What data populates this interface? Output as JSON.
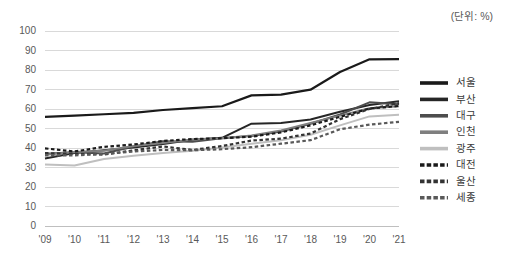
{
  "unit_note": "(단위: %)",
  "chart_data": {
    "type": "line",
    "title": "",
    "xlabel": "",
    "ylabel": "",
    "unit": "(단위: %)",
    "ylim": [
      0,
      100
    ],
    "ytick_step": 10,
    "yticks": [
      "0",
      "10",
      "20",
      "30",
      "40",
      "50",
      "60",
      "70",
      "80",
      "90",
      "100"
    ],
    "grid": true,
    "legend_position": "right",
    "categories": [
      "'09",
      "'10",
      "'11",
      "'12",
      "'13",
      "'14",
      "'15",
      "'16",
      "'17",
      "'18",
      "'19",
      "'20",
      "'21"
    ],
    "series": [
      {
        "name": "서울",
        "color": "#1a1a1a",
        "width": 2.2,
        "dash": "none",
        "values": [
          56.0,
          56.6,
          57.3,
          58.0,
          59.5,
          60.4,
          61.4,
          67.0,
          67.4,
          69.9,
          79.0,
          85.5,
          85.6
        ]
      },
      {
        "name": "부산",
        "color": "#262626",
        "width": 2.0,
        "dash": "none",
        "values": [
          34.6,
          37.4,
          38.8,
          40.2,
          42.0,
          44.2,
          45.2,
          52.5,
          52.8,
          54.6,
          58.6,
          62.0,
          64.0
        ]
      },
      {
        "name": "대구",
        "color": "#4d4d4d",
        "width": 2.0,
        "dash": "none",
        "values": [
          37.0,
          37.8,
          37.2,
          40.8,
          43.5,
          43.2,
          45.0,
          46.2,
          48.4,
          52.4,
          57.2,
          63.4,
          62.4
        ]
      },
      {
        "name": "인천",
        "color": "#7f7f7f",
        "width": 2.0,
        "dash": "none",
        "values": [
          36.6,
          38.0,
          38.6,
          41.0,
          42.6,
          44.4,
          45.0,
          46.4,
          49.0,
          52.8,
          56.6,
          60.4,
          61.4
        ]
      },
      {
        "name": "광주",
        "color": "#bfbfbf",
        "width": 2.0,
        "dash": "none",
        "values": [
          31.5,
          31.0,
          34.4,
          36.0,
          37.4,
          38.6,
          40.2,
          42.2,
          44.0,
          46.8,
          51.6,
          56.2,
          57.0
        ]
      },
      {
        "name": "대전",
        "color": "#1a1a1a",
        "width": 2.2,
        "dash": "3.5,2.5",
        "values": [
          39.8,
          38.2,
          40.6,
          41.8,
          43.6,
          44.6,
          45.0,
          45.8,
          48.0,
          51.6,
          56.0,
          60.2,
          61.6
        ]
      },
      {
        "name": "울산",
        "color": "#333333",
        "width": 2.2,
        "dash": "3.5,2.5",
        "values": [
          37.4,
          37.0,
          36.6,
          38.8,
          40.8,
          39.0,
          41.0,
          43.8,
          44.8,
          47.4,
          54.8,
          60.0,
          63.0
        ]
      },
      {
        "name": "세종",
        "color": "#595959",
        "width": 2.2,
        "dash": "3.5,2.5",
        "values": [
          36.2,
          36.2,
          37.0,
          38.2,
          39.0,
          38.8,
          39.4,
          40.4,
          42.2,
          44.0,
          49.6,
          52.0,
          53.4
        ]
      }
    ]
  }
}
